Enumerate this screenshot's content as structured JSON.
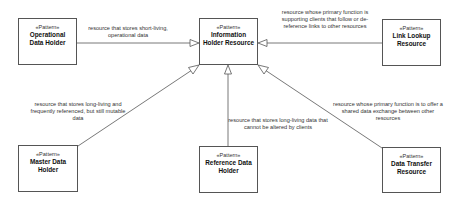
{
  "diagram": {
    "stereotype": "«Pattern»",
    "nodes": [
      {
        "id": "info",
        "name_line1": "Information",
        "name_line2": "Holder Resource"
      },
      {
        "id": "operational",
        "name_line1": "Operational",
        "name_line2": "Data Holder"
      },
      {
        "id": "link",
        "name_line1": "Link Lookup",
        "name_line2": "Resource"
      },
      {
        "id": "master",
        "name_line1": "Master Data",
        "name_line2": "Holder"
      },
      {
        "id": "reference",
        "name_line1": "Reference Data",
        "name_line2": "Holder"
      },
      {
        "id": "transfer",
        "name_line1": "Data Transfer",
        "name_line2": "Resource"
      }
    ],
    "edges": [
      {
        "from": "operational",
        "to": "info",
        "type": "generalization",
        "label": "resource that stores short-living, operational data"
      },
      {
        "from": "link",
        "to": "info",
        "type": "generalization",
        "label": "resource whose primary function is supporting clients that follow or de-reference links to other resources"
      },
      {
        "from": "master",
        "to": "info",
        "type": "generalization",
        "label": "resource that stores long-living and frequently referenced, but still mutable data"
      },
      {
        "from": "reference",
        "to": "info",
        "type": "generalization",
        "label": "resource that stores long-living data that cannot be altered by clients"
      },
      {
        "from": "transfer",
        "to": "info",
        "type": "generalization",
        "label": "resource whose primary function is to offer a shared data exchange between other resources"
      }
    ]
  }
}
